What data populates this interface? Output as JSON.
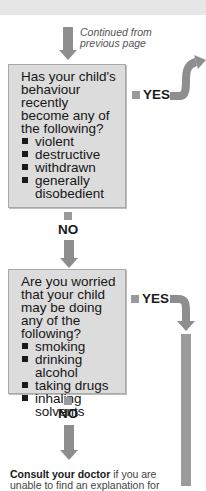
{
  "header": {
    "continued_note": "Continued from\nprevious page"
  },
  "question1": {
    "text": "Has your child's behaviour recently become any of the following?",
    "items": [
      "violent",
      "destructive",
      "withdrawn",
      "generally disobedient"
    ],
    "yes_label": "YES",
    "no_label": "NO"
  },
  "question2": {
    "text": "Are you worried that your child may be doing any of the following?",
    "items": [
      "smoking",
      "drinking alcohol",
      "taking drugs",
      "inhaling solvents"
    ],
    "yes_label": "YES",
    "no_label": "NO"
  },
  "footer": {
    "bold": "Consult your doctor",
    "text": " if you are unable to find an explanation for"
  },
  "colors": {
    "box_fill": "#dcdcdc",
    "arrow": "#8e8e8e",
    "top_strip": "#e6e6e6"
  }
}
